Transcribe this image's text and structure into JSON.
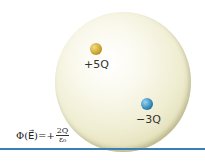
{
  "diagram": {
    "charges": [
      {
        "label": "+5Q",
        "color": "#c9a22c"
      },
      {
        "label": "−3Q",
        "color": "#2f86b8"
      }
    ],
    "flux": {
      "lhs": "Φ(E⃗)=+",
      "numerator": "2Q",
      "denominator": "ε₀"
    },
    "colors": {
      "sphere": "#eeeccf",
      "rule": "#3b7fb4"
    }
  }
}
